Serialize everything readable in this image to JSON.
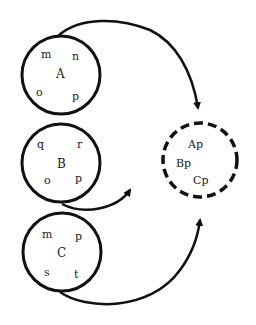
{
  "diagram": {
    "sets": [
      {
        "id": "A",
        "label": "A",
        "members": [
          "m",
          "n",
          "o",
          "p"
        ]
      },
      {
        "id": "B",
        "label": "B",
        "members": [
          "q",
          "r",
          "o",
          "p"
        ]
      },
      {
        "id": "C",
        "label": "C",
        "members": [
          "m",
          "p",
          "s",
          "t"
        ]
      }
    ],
    "result": {
      "style": "dashed",
      "members": [
        "Ap",
        "Bp",
        "Cp"
      ]
    },
    "arrows": [
      {
        "from": "A",
        "to": "result"
      },
      {
        "from": "B",
        "to": "result"
      },
      {
        "from": "C",
        "to": "result"
      }
    ],
    "stroke_color": "#111111"
  }
}
